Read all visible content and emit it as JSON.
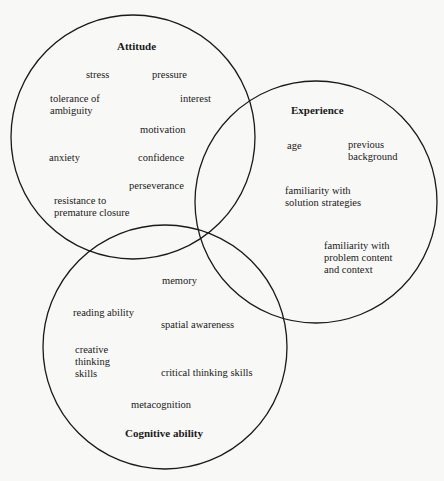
{
  "diagram": {
    "type": "venn",
    "circles": [
      {
        "id": "attitude",
        "title": "Attitude",
        "cx": 133,
        "cy": 137,
        "r": 122,
        "items": [
          "stress",
          "pressure",
          "tolerance of\nambiguity",
          "interest",
          "motivation",
          "anxiety",
          "confidence",
          "perseverance",
          "resistance to\npremature closure"
        ]
      },
      {
        "id": "experience",
        "title": "Experience",
        "cx": 316,
        "cy": 202,
        "r": 121,
        "items": [
          "age",
          "previous\nbackground",
          "familiarity with\nsolution strategies",
          "familiarity with\nproblem content\nand context"
        ]
      },
      {
        "id": "cognitive",
        "title": "Cognitive ability",
        "cx": 165,
        "cy": 347,
        "r": 122,
        "items": [
          "memory",
          "reading ability",
          "spatial awareness",
          "creative\nthinking\nskills",
          "critical thinking skills",
          "metacognition"
        ]
      }
    ]
  },
  "attitude": {
    "title": "Attitude",
    "stress": "stress",
    "pressure": "pressure",
    "tolerance": "tolerance of\nambiguity",
    "interest": "interest",
    "motivation": "motivation",
    "anxiety": "anxiety",
    "confidence": "confidence",
    "perseverance": "perseverance",
    "resistance": "resistance to\npremature closure"
  },
  "experience": {
    "title": "Experience",
    "age": "age",
    "previous": "previous\nbackground",
    "solution": "familiarity with\nsolution strategies",
    "problem": "familiarity with\nproblem content\nand context"
  },
  "cognitive": {
    "title": "Cognitive ability",
    "memory": "memory",
    "reading": "reading ability",
    "spatial": "spatial awareness",
    "creative": "creative\nthinking\nskills",
    "critical": "critical thinking skills",
    "metacognition": "metacognition"
  },
  "colors": {
    "stroke": "#1a1a1a",
    "background": "#f8f8f6"
  }
}
